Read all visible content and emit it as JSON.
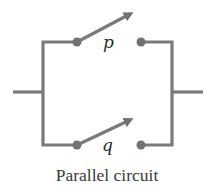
{
  "diagram": {
    "caption": "Parallel circuit",
    "switches": [
      {
        "id": "p",
        "label": "p",
        "state": "open"
      },
      {
        "id": "q",
        "label": "q",
        "state": "open"
      }
    ],
    "colors": {
      "wire": "#7a7a7a",
      "terminal": "#727272",
      "text": "#2a2a2a",
      "background": "#ffffff"
    }
  }
}
